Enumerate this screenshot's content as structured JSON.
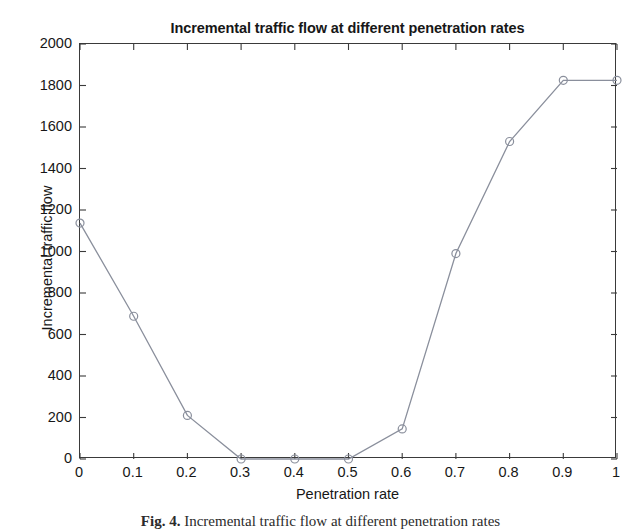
{
  "chart_data": {
    "type": "line",
    "title": "Incremental traffic flow at different penetration rates",
    "xlabel": "Penetration rate",
    "ylabel": "Incremental traffic flow",
    "x": [
      0,
      0.1,
      0.2,
      0.3,
      0.4,
      0.5,
      0.6,
      0.7,
      0.8,
      0.9,
      1
    ],
    "values": [
      1137,
      688,
      210,
      0,
      0,
      0,
      145,
      990,
      1530,
      1825,
      1825
    ],
    "xlim": [
      0,
      1
    ],
    "ylim": [
      0,
      2000
    ],
    "xticks": [
      "0",
      "0.1",
      "0.2",
      "0.3",
      "0.4",
      "0.5",
      "0.6",
      "0.7",
      "0.8",
      "0.9",
      "1"
    ],
    "yticks": [
      "0",
      "200",
      "400",
      "600",
      "800",
      "1000",
      "1200",
      "1400",
      "1600",
      "1800",
      "2000"
    ],
    "grid": false,
    "legend": null,
    "marker": "open-circle",
    "line_color": "#8a8f9c",
    "marker_color": "#8a8f9c",
    "axis_color": "#3a3a3a",
    "background": "#ffffff"
  },
  "caption": {
    "figure_number": "Fig. 4.",
    "text": "Incremental traffic flow at different penetration rates"
  }
}
